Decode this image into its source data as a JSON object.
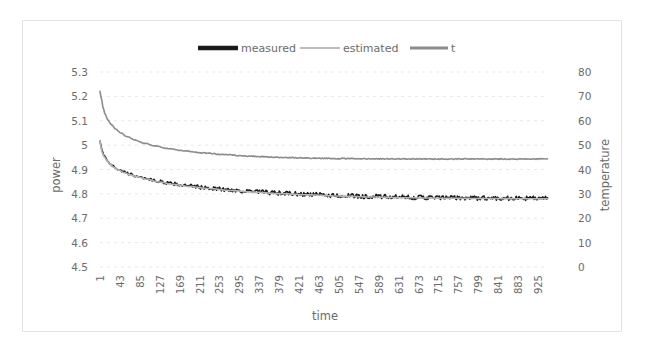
{
  "chart_data": {
    "type": "line",
    "title": "",
    "xlabel": "time",
    "ylabel": "power",
    "y2label": "temperature",
    "ylim": [
      4.5,
      5.3
    ],
    "y2lim": [
      0,
      80
    ],
    "xlim": [
      1,
      946
    ],
    "grid": true,
    "legend_position": "top-center",
    "y_ticks": [
      "5.3",
      "5.2",
      "5.1",
      "5",
      "4.9",
      "4.8",
      "4.7",
      "4.6",
      "4.5"
    ],
    "y_tick_values": [
      5.3,
      5.2,
      5.1,
      5.0,
      4.9,
      4.8,
      4.7,
      4.6,
      4.5
    ],
    "y2_ticks": [
      "80",
      "70",
      "60",
      "50",
      "40",
      "30",
      "20",
      "10",
      "0"
    ],
    "y2_tick_values": [
      80,
      70,
      60,
      50,
      40,
      30,
      20,
      10,
      0
    ],
    "x_ticks": [
      "1",
      "43",
      "85",
      "127",
      "169",
      "211",
      "253",
      "295",
      "337",
      "379",
      "421",
      "463",
      "505",
      "547",
      "589",
      "631",
      "673",
      "715",
      "757",
      "799",
      "841",
      "883",
      "925"
    ],
    "x_tick_values": [
      1,
      43,
      85,
      127,
      169,
      211,
      253,
      295,
      337,
      379,
      421,
      463,
      505,
      547,
      589,
      631,
      673,
      715,
      757,
      799,
      841,
      883,
      925
    ],
    "series": [
      {
        "name": "measured",
        "axis": "left",
        "color": "#1a1a1a",
        "width": 1.6,
        "noise": 0.009,
        "x": [
          1,
          5,
          10,
          16,
          22,
          30,
          40,
          52,
          65,
          80,
          100,
          125,
          155,
          190,
          230,
          275,
          325,
          380,
          440,
          505,
          575,
          650,
          730,
          815,
          905,
          946
        ],
        "values": [
          5.02,
          4.975,
          4.955,
          4.938,
          4.925,
          4.912,
          4.9,
          4.889,
          4.88,
          4.872,
          4.862,
          4.851,
          4.841,
          4.832,
          4.824,
          4.816,
          4.809,
          4.803,
          4.798,
          4.793,
          4.789,
          4.786,
          4.784,
          4.783,
          4.782,
          4.782
        ]
      },
      {
        "name": "estimated",
        "axis": "left",
        "color": "#b5b5b5",
        "width": 1.6,
        "noise": 0.0,
        "x": [
          1,
          5,
          10,
          16,
          22,
          30,
          40,
          52,
          65,
          80,
          100,
          125,
          155,
          190,
          230,
          275,
          325,
          380,
          440,
          505,
          575,
          650,
          730,
          815,
          905,
          946
        ],
        "values": [
          5.015,
          4.972,
          4.952,
          4.935,
          4.922,
          4.909,
          4.897,
          4.887,
          4.878,
          4.87,
          4.86,
          4.849,
          4.839,
          4.83,
          4.822,
          4.814,
          4.807,
          4.801,
          4.796,
          4.791,
          4.787,
          4.784,
          4.782,
          4.781,
          4.78,
          4.78
        ]
      },
      {
        "name": "t",
        "axis": "right",
        "color": "#8c8c8c",
        "width": 1.6,
        "noise": 0.18,
        "x": [
          1,
          4,
          8,
          12,
          18,
          25,
          34,
          45,
          58,
          74,
          94,
          118,
          147,
          181,
          220,
          265,
          315,
          372,
          435,
          505,
          580,
          660,
          745,
          835,
          925,
          946
        ],
        "values": [
          72.0,
          69.0,
          65.0,
          62.5,
          60.2,
          58.4,
          56.6,
          55.0,
          53.5,
          52.2,
          50.8,
          49.6,
          48.5,
          47.6,
          46.8,
          46.1,
          45.5,
          45.0,
          44.7,
          44.5,
          44.4,
          44.35,
          44.3,
          44.3,
          44.3,
          44.3
        ]
      }
    ],
    "legend": [
      {
        "label": "measured",
        "color": "#1a1a1a",
        "width": 4.5
      },
      {
        "label": "estimated",
        "color": "#bdbdbd",
        "width": 2.0
      },
      {
        "label": "t",
        "color": "#8c8c8c",
        "width": 3.0
      }
    ]
  },
  "colors": {
    "measured": "#1a1a1a",
    "estimated": "#b5b5b5",
    "temperature": "#8c8c8c",
    "grid": "#e8e8e8",
    "text": "#6b6b6b",
    "frame": "#e3e3e3"
  }
}
